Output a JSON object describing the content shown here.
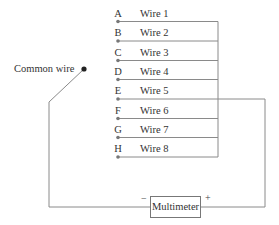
{
  "diagram": {
    "common_wire_label": "Common wire",
    "multimeter_label": "Multimeter",
    "negative_terminal": "−",
    "positive_terminal": "+",
    "wires": [
      {
        "letter": "A",
        "label": "Wire 1"
      },
      {
        "letter": "B",
        "label": "Wire 2"
      },
      {
        "letter": "C",
        "label": "Wire 3"
      },
      {
        "letter": "D",
        "label": "Wire 4"
      },
      {
        "letter": "E",
        "label": "Wire 5"
      },
      {
        "letter": "F",
        "label": "Wire 6"
      },
      {
        "letter": "G",
        "label": "Wire 7"
      },
      {
        "letter": "H",
        "label": "Wire 8"
      }
    ],
    "connected_wire": "E",
    "colors": {
      "line": "#8a8a8a",
      "dot": "#777777",
      "common_dot": "#222222"
    }
  }
}
